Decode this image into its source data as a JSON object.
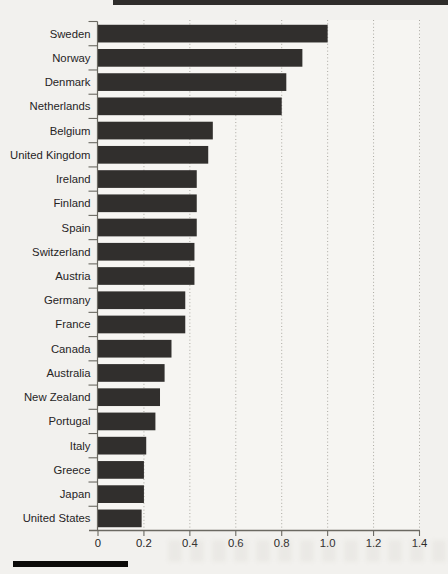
{
  "page": {
    "background": "#f2f1ee",
    "plot_background": "#f6f5f2"
  },
  "decorations": {
    "top_rule_color": "#2f2d2b",
    "bottom_rule_color": "#0c0b09"
  },
  "chart_data": {
    "type": "bar",
    "orientation": "horizontal",
    "title": "",
    "xlabel": "",
    "ylabel": "",
    "categories": [
      "Sweden",
      "Norway",
      "Denmark",
      "Netherlands",
      "Belgium",
      "United Kingdom",
      "Ireland",
      "Finland",
      "Spain",
      "Switzerland",
      "Austria",
      "Germany",
      "France",
      "Canada",
      "Australia",
      "New Zealand",
      "Portugal",
      "Italy",
      "Greece",
      "Japan",
      "United States"
    ],
    "values": [
      1.0,
      0.89,
      0.82,
      0.8,
      0.5,
      0.48,
      0.43,
      0.43,
      0.43,
      0.42,
      0.42,
      0.38,
      0.38,
      0.32,
      0.29,
      0.27,
      0.25,
      0.21,
      0.2,
      0.2,
      0.19
    ],
    "xlim": [
      0,
      1.4
    ],
    "x_ticks": [
      0,
      0.2,
      0.4,
      0.6,
      0.8,
      1.0,
      1.2,
      1.4
    ],
    "x_tick_labels": [
      "0",
      "0.2",
      "0.4",
      "0.6",
      "0.8",
      "1.0",
      "1.2",
      "1.4"
    ],
    "grid": "vertical-dotted",
    "legend": "none",
    "colors": {
      "bar": "#312f2d",
      "axis": "#6b6962",
      "tick": "#6b6962",
      "gridline": "#aaa8a1",
      "label": "#26241f"
    }
  }
}
